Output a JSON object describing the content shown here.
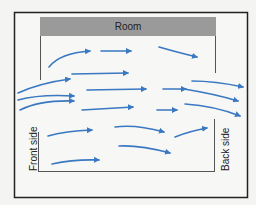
{
  "diagram": {
    "title": "Room",
    "left_label": "Front side",
    "right_label": "Back side",
    "colors": {
      "arrow": "#3a78c2",
      "header": "#999999",
      "frame": "#222222",
      "background": "#f4f4f2"
    },
    "arrow_count": 19,
    "flow_direction": "left-to-right"
  }
}
